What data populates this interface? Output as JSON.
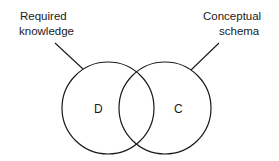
{
  "diagram": {
    "type": "venn",
    "labels": {
      "left_line1": "Required",
      "left_line2": "knowledge",
      "right_line1": "Conceptual",
      "right_line2": "schema"
    },
    "sets": {
      "left": "D",
      "right": "C"
    },
    "colors": {
      "stroke": "#1a1a1a",
      "background": "#ffffff"
    }
  }
}
